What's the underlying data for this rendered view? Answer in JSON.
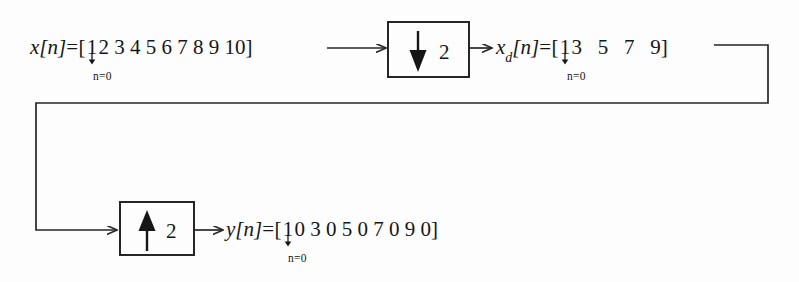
{
  "diagram": {
    "line_color": "#262626",
    "text_color": "#161616",
    "background": "#fdfdfd",
    "index_label": "n=0",
    "input": {
      "name_base": "x",
      "name_arg": "[n]",
      "equals": "=",
      "open_bracket": "[",
      "close_bracket": "]",
      "origin_value": "1",
      "rest_values": "2 3 4 5 6 7 8 9 10",
      "full_sequence": "[1 2 3 4 5 6 7 8 9 10]"
    },
    "downsampled": {
      "name_base": "x",
      "name_sub": "d",
      "name_arg": "[n]",
      "equals": "=",
      "open_bracket": "[",
      "close_bracket": "]",
      "origin_value": "1",
      "rest_values": "3   5   7   9",
      "full_sequence": "[1 3 5 7 9]"
    },
    "output": {
      "name_base": "y",
      "name_arg": "[n]",
      "equals": "=",
      "open_bracket": "[",
      "close_bracket": "]",
      "origin_value": "1",
      "rest_values": "0 3 0 5 0 7 0 9 0",
      "full_sequence": "[1 0 3 0 5 0 7 0 9 0]"
    },
    "decimator": {
      "label": "downsampler-block",
      "factor": "2",
      "operation": "decimate",
      "arrow_direction": "down"
    },
    "interpolator": {
      "label": "upsampler-block",
      "factor": "2",
      "operation": "interpolate",
      "arrow_direction": "up"
    }
  }
}
